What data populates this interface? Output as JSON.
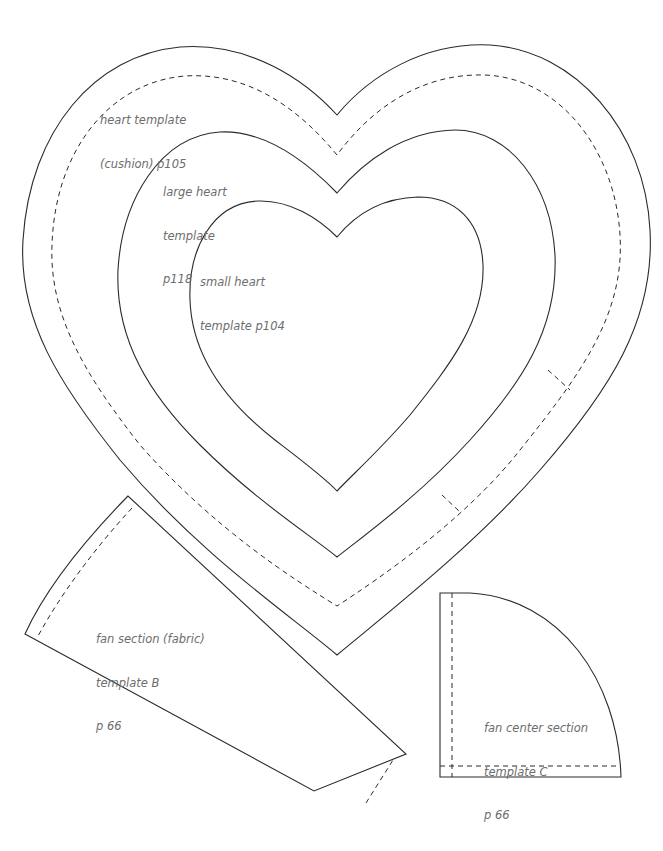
{
  "page": {
    "background": "#ffffff",
    "line_color": "#2a2a2a",
    "label_color": "#6d6d6d"
  },
  "templates": {
    "heart_cushion": {
      "lines": [
        "heart template",
        "(cushion) p105"
      ],
      "page_ref": "p105"
    },
    "large_heart": {
      "lines": [
        "large heart",
        "template",
        "p118"
      ],
      "page_ref": "p118"
    },
    "small_heart": {
      "lines": [
        "small heart",
        "template p104"
      ],
      "page_ref": "p104"
    },
    "fan_section": {
      "lines": [
        "fan section (fabric)",
        "template B",
        "p 66"
      ],
      "page_ref": "p 66"
    },
    "fan_center": {
      "lines": [
        "fan center section",
        "template C",
        "p 66"
      ],
      "page_ref": "p 66"
    }
  }
}
